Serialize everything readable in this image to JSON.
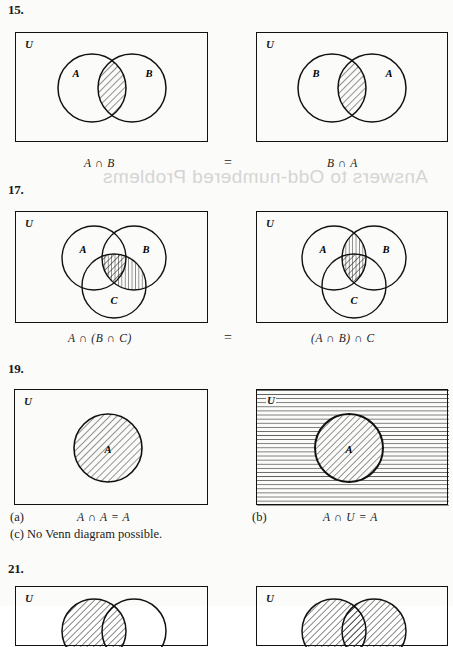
{
  "page": {
    "background_color": "#fbfbf9",
    "ink_color": "#111111",
    "bleed_through_text": "Answers to Odd-numbered Problems"
  },
  "problems": [
    {
      "number": "15.",
      "left": {
        "universe_label": "U",
        "set_labels": [
          "A",
          "B"
        ],
        "caption": "A ∩ B",
        "shading": "intersection-diagonal"
      },
      "relation": "=",
      "right": {
        "universe_label": "U",
        "set_labels": [
          "B",
          "A"
        ],
        "caption": "B ∩ A",
        "shading": "intersection-diagonal"
      }
    },
    {
      "number": "17.",
      "left": {
        "universe_label": "U",
        "set_labels": [
          "A",
          "B",
          "C"
        ],
        "caption": "A ∩ (B ∩ C)",
        "shading": "triple-diagonal-plus-BC-vertical"
      },
      "relation": "=",
      "right": {
        "universe_label": "U",
        "set_labels": [
          "A",
          "B",
          "C"
        ],
        "caption": "(A ∩ B) ∩ C",
        "shading": "triple-diagonal-plus-AB-vertical"
      }
    },
    {
      "number": "19.",
      "left": {
        "part_label": "(a)",
        "universe_label": "U",
        "set_labels": [
          "A"
        ],
        "caption": "A ∩ A = A",
        "shading": "circle-diagonal"
      },
      "right": {
        "part_label": "(b)",
        "universe_label": "U",
        "set_labels": [
          "A"
        ],
        "caption": "A ∩ U = A",
        "shading": "box-horizontal-circle-diagonal"
      },
      "note": "(c)  No Venn diagram possible."
    },
    {
      "number": "21.",
      "left": {
        "universe_label": "U",
        "set_labels": [],
        "caption": "",
        "shading": "two-circles-diagonal-partial"
      },
      "right": {
        "universe_label": "U",
        "set_labels": [],
        "caption": "",
        "shading": "two-circles-diagonal-partial"
      }
    }
  ]
}
